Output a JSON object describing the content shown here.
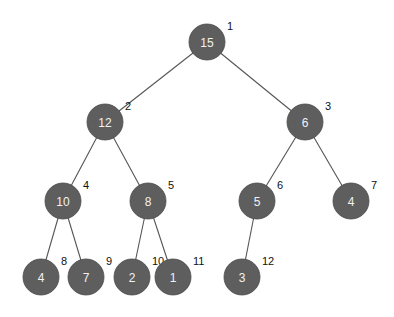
{
  "diagram": {
    "type": "binary-heap-tree",
    "node_radius": 18,
    "colors": {
      "node_fill": "#5e5e5e",
      "node_text": "#f2f2f2",
      "index_text": "#111111",
      "edge": "#555555",
      "background": "#ffffff"
    },
    "nodes": [
      {
        "index": "1",
        "value": "15",
        "x": 207,
        "y": 42
      },
      {
        "index": "2",
        "value": "12",
        "x": 105,
        "y": 122
      },
      {
        "index": "3",
        "value": "6",
        "x": 305,
        "y": 122
      },
      {
        "index": "4",
        "value": "10",
        "x": 63,
        "y": 201
      },
      {
        "index": "5",
        "value": "8",
        "x": 148,
        "y": 201
      },
      {
        "index": "6",
        "value": "5",
        "x": 257,
        "y": 201
      },
      {
        "index": "7",
        "value": "4",
        "x": 351,
        "y": 201
      },
      {
        "index": "8",
        "value": "4",
        "x": 41,
        "y": 277
      },
      {
        "index": "9",
        "value": "7",
        "x": 86,
        "y": 277
      },
      {
        "index": "10",
        "value": "2",
        "x": 132,
        "y": 277
      },
      {
        "index": "11",
        "value": "1",
        "x": 173,
        "y": 277
      },
      {
        "index": "12",
        "value": "3",
        "x": 242,
        "y": 277
      }
    ],
    "edges": [
      {
        "from": "1",
        "to": "2"
      },
      {
        "from": "1",
        "to": "3"
      },
      {
        "from": "2",
        "to": "4"
      },
      {
        "from": "2",
        "to": "5"
      },
      {
        "from": "3",
        "to": "6"
      },
      {
        "from": "3",
        "to": "7"
      },
      {
        "from": "4",
        "to": "8"
      },
      {
        "from": "4",
        "to": "9"
      },
      {
        "from": "5",
        "to": "10"
      },
      {
        "from": "5",
        "to": "11"
      },
      {
        "from": "6",
        "to": "12"
      }
    ]
  }
}
